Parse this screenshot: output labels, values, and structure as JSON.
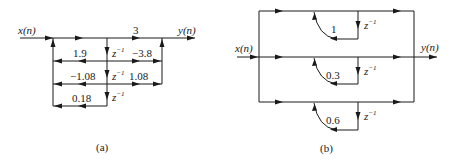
{
  "figure_a": {
    "caption": "(a)",
    "input_label": "x(n)",
    "output_label": "y(n)",
    "delay_label": "z",
    "delay_exp": "−1",
    "forward_gains": [
      "3",
      "−3.8",
      "1.08"
    ],
    "feedback_gains": [
      "1.9",
      "−1.08",
      "0.18"
    ]
  },
  "figure_b": {
    "caption": "(b)",
    "input_label": "x(n)",
    "output_label": "y(n)",
    "delay_label": "z",
    "delay_exp": "−1",
    "feedback_gains": [
      "1",
      "0.3",
      "0.6"
    ]
  }
}
